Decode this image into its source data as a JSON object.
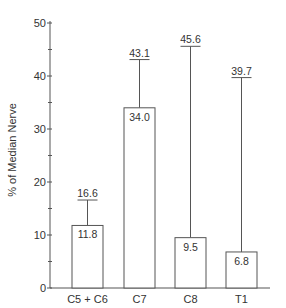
{
  "chart_data": {
    "type": "bar",
    "title": "",
    "xlabel": "",
    "ylabel": "% of Median Nerve",
    "ylim": [
      0,
      50
    ],
    "yticks": [
      0,
      10,
      20,
      30,
      40,
      50
    ],
    "minor_yticks": [
      5,
      15,
      25,
      35,
      45
    ],
    "grid": false,
    "categories": [
      "C5 + C6",
      "C7",
      "C8",
      "T1"
    ],
    "values": [
      11.8,
      34.0,
      9.5,
      6.8
    ],
    "value_labels": [
      "11.8",
      "34.0",
      "9.5",
      "6.8"
    ],
    "error_upper": [
      16.6,
      43.1,
      45.6,
      39.7
    ],
    "error_labels": [
      "16.6",
      "43.1",
      "45.6",
      "39.7"
    ],
    "colors": {
      "bar_fill": "#ffffff",
      "stroke": "#555555",
      "text": "#333333"
    }
  }
}
